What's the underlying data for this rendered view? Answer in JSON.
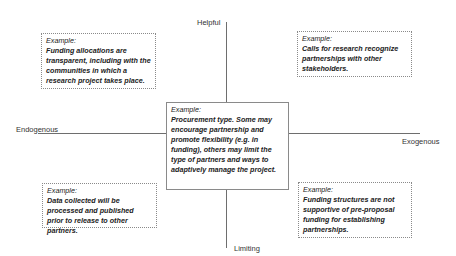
{
  "axes": {
    "top": "Helpful",
    "bottom": "Limiting",
    "left": "Endogenous",
    "right": "Exogenous"
  },
  "quadrants": {
    "top_left": {
      "title": "Example:",
      "body": "Funding allocations are transparent, including with the communities in which a research project takes place."
    },
    "top_right": {
      "title": "Example:",
      "body": "Calls for research recognize partnerships with other stakeholders."
    },
    "center": {
      "title": "Example:",
      "body": "Procurement type. Some may encourage partnership and promote flexibility (e.g. in funding), others may limit the type of partners and ways to adaptively manage the project."
    },
    "bottom_left": {
      "title": "Example:",
      "body": "Data collected will be processed and published prior to release to other partners."
    },
    "bottom_right": {
      "title": "Example:",
      "body": "Funding structures are not supportive of pre-proposal funding for establishing partnerships."
    }
  }
}
